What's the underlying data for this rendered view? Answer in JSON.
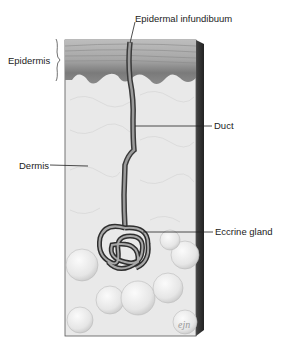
{
  "diagram": {
    "labels": {
      "infundibulum": "Epidermal infundibuum",
      "epidermis": "Epidermis",
      "dermis": "Dermis",
      "duct": "Duct",
      "gland": "Eccrine gland"
    },
    "signature": "ejn"
  }
}
